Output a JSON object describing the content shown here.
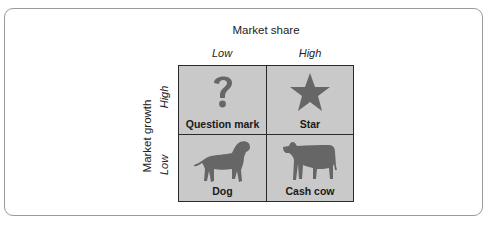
{
  "diagram": {
    "type": "bcg-growth-share-matrix",
    "x_axis": {
      "title": "Market share",
      "labels": [
        "Low",
        "High"
      ]
    },
    "y_axis": {
      "title": "Market growth",
      "labels": [
        "High",
        "Low"
      ]
    },
    "cells": [
      {
        "label": "Question mark",
        "icon": "question-mark-icon",
        "position": "top-left"
      },
      {
        "label": "Star",
        "icon": "star-icon",
        "position": "top-right"
      },
      {
        "label": "Dog",
        "icon": "dog-icon",
        "position": "bottom-left"
      },
      {
        "label": "Cash cow",
        "icon": "cow-icon",
        "position": "bottom-right"
      }
    ],
    "colors": {
      "cell_bg": "#c9c9c9",
      "icon": "#666666",
      "border": "#2a2a2a",
      "frame": "#9a9a9a"
    }
  }
}
